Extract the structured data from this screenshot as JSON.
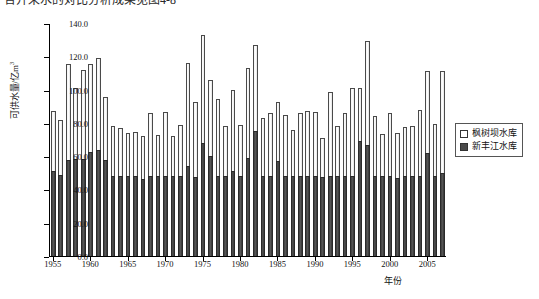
{
  "figure": {
    "clipped_caption": "合开采水的对比分析成果见图4-8",
    "ylabel": "可供水量/亿m",
    "ylabel_sup": "3",
    "xlabel": "年份"
  },
  "legend": {
    "position": "right-middle",
    "items": [
      {
        "label": "枫树坝水库",
        "swatch": "hollow",
        "color": "#ffffff"
      },
      {
        "label": "新丰江水库",
        "swatch": "filled",
        "color": "#4a4a4a"
      }
    ]
  },
  "chart_data": {
    "type": "bar",
    "stacked": true,
    "title": "",
    "xlabel": "年份",
    "ylabel": "可供水量/亿m³",
    "ylim": [
      0.0,
      140.0
    ],
    "yticks": [
      "0.0",
      "20.0",
      "40.0",
      "60.0",
      "80.0",
      "100.0",
      "120.0",
      "140.0"
    ],
    "ytick_values": [
      0,
      20,
      40,
      60,
      80,
      100,
      120,
      140
    ],
    "xticks": [
      "1955",
      "1960",
      "1965",
      "1970",
      "1975",
      "1980",
      "1985",
      "1990",
      "1995",
      "2000",
      "2005"
    ],
    "xtick_values": [
      1955,
      1960,
      1965,
      1970,
      1975,
      1980,
      1985,
      1990,
      1995,
      2000,
      2005
    ],
    "grid": false,
    "legend_position": "right",
    "categories": [
      1955,
      1956,
      1957,
      1958,
      1959,
      1960,
      1961,
      1962,
      1963,
      1964,
      1965,
      1966,
      1967,
      1968,
      1969,
      1970,
      1971,
      1972,
      1973,
      1974,
      1975,
      1976,
      1977,
      1978,
      1979,
      1980,
      1981,
      1982,
      1983,
      1984,
      1985,
      1986,
      1987,
      1988,
      1989,
      1990,
      1991,
      1992,
      1993,
      1994,
      1995,
      1996,
      1997,
      1998,
      1999,
      2000,
      2001,
      2002,
      2003,
      2004,
      2005,
      2006,
      2007
    ],
    "series": [
      {
        "name": "新丰江水库",
        "color": "#4a4a4a",
        "values": [
          51.0,
          48.5,
          57.5,
          58.5,
          58.0,
          62.5,
          64.0,
          57.5,
          48.0,
          48.0,
          48.0,
          48.0,
          46.0,
          48.0,
          48.0,
          48.0,
          48.0,
          48.0,
          54.0,
          47.5,
          68.0,
          60.0,
          48.0,
          48.0,
          51.0,
          48.0,
          59.0,
          75.0,
          48.0,
          48.0,
          57.0,
          48.0,
          48.0,
          48.0,
          48.0,
          48.0,
          47.5,
          48.0,
          48.0,
          48.0,
          48.0,
          69.0,
          67.0,
          48.0,
          48.0,
          48.0,
          47.0,
          48.0,
          48.0,
          48.0,
          62.0,
          48.0,
          50.0
        ]
      },
      {
        "name": "枫树坝水库",
        "color": "#ffffff",
        "values": [
          36.0,
          33.5,
          58.0,
          42.5,
          53.5,
          53.0,
          55.0,
          38.0,
          30.0,
          29.0,
          26.0,
          26.5,
          26.0,
          38.0,
          24.5,
          38.5,
          24.0,
          30.5,
          62.0,
          45.0,
          65.0,
          46.0,
          46.5,
          30.0,
          49.0,
          30.5,
          54.0,
          52.0,
          35.0,
          38.0,
          35.5,
          37.0,
          27.5,
          38.0,
          39.0,
          38.5,
          23.5,
          50.5,
          30.0,
          38.0,
          53.0,
          32.0,
          62.0,
          36.0,
          25.5,
          38.0,
          27.0,
          29.5,
          30.0,
          39.5,
          49.0,
          31.5,
          61.0
        ]
      }
    ],
    "totals": [
      87.0,
      82.0,
      115.5,
      101.0,
      111.5,
      115.5,
      119.0,
      95.5,
      78.0,
      77.0,
      74.0,
      74.5,
      72.0,
      86.0,
      72.5,
      86.5,
      72.0,
      78.5,
      116.0,
      92.5,
      133.0,
      106.0,
      94.5,
      78.0,
      100.0,
      78.5,
      113.0,
      127.0,
      83.0,
      86.0,
      92.5,
      85.0,
      75.5,
      86.0,
      87.0,
      86.5,
      71.0,
      98.5,
      78.0,
      86.0,
      101.0,
      101.0,
      129.0,
      84.0,
      73.5,
      86.0,
      74.0,
      77.5,
      78.0,
      87.5,
      111.0,
      79.5,
      111.0
    ]
  }
}
